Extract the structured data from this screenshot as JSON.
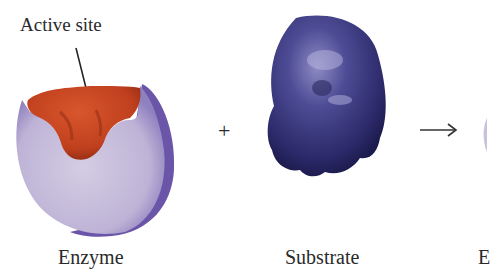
{
  "diagram": {
    "callout": {
      "label": "Active site"
    },
    "items": [
      {
        "id": "enzyme",
        "label": "Enzyme"
      },
      {
        "id": "substrate",
        "label": "Substrate"
      },
      {
        "id": "product-partial",
        "label": "E"
      }
    ],
    "operators": {
      "plus": "+",
      "arrow": "→"
    },
    "colors": {
      "enzyme_body": "#c9c0dc",
      "enzyme_shadow": "#6a55a8",
      "active_site": "#c8431f",
      "substrate": "#3b3a7a",
      "background": "#ffffff"
    }
  }
}
